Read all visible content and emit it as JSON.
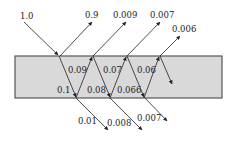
{
  "diagram": {
    "slab": {
      "x": 15,
      "y": 56,
      "width": 207,
      "height": 42,
      "fill": "#d9d9d9",
      "stroke": "#555555"
    },
    "incident": {
      "label": "1.0",
      "value": 1.0
    },
    "reflected": [
      {
        "label": "0.9",
        "value": 0.9
      },
      {
        "label": "0.009",
        "value": 0.009
      },
      {
        "label": "0.007",
        "value": 0.007
      },
      {
        "label": "0.006",
        "value": 0.006
      }
    ],
    "internal_upward": [
      {
        "label": "0.09",
        "value": 0.09
      },
      {
        "label": "0.07",
        "value": 0.07
      },
      {
        "label": "0.06",
        "value": 0.06
      }
    ],
    "internal_downward": [
      {
        "label": "0.1",
        "value": 0.1
      },
      {
        "label": "0.08",
        "value": 0.08
      },
      {
        "label": "0.066",
        "value": 0.066
      }
    ],
    "transmitted": [
      {
        "label": "0.01",
        "value": 0.01
      },
      {
        "label": "0.008",
        "value": 0.008
      },
      {
        "label": "0.007",
        "value": 0.007
      }
    ]
  }
}
